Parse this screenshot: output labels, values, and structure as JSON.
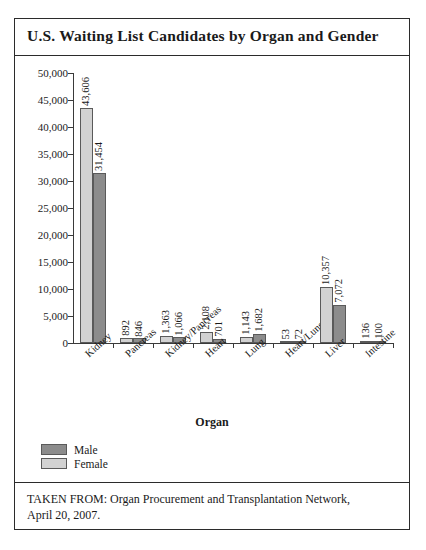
{
  "figure": {
    "title": "U.S. Waiting List Candidates by Organ and Gender",
    "source_line1": "TAKEN FROM: Organ Procurement and Transplantation Network,",
    "source_line2": "April 20, 2007."
  },
  "legend": {
    "male_label": "Male",
    "female_label": "Female"
  },
  "colors": {
    "male_bar": "#d2d2d2",
    "female_bar": "#8c8c8c",
    "male_swatch": "#8c8c8c",
    "female_swatch": "#d2d2d2",
    "axis": "#3a3a3a",
    "border": "#2b2b2b"
  },
  "chart_data": {
    "type": "bar",
    "title": "U.S. Waiting List Candidates by Organ and Gender",
    "xlabel": "Organ",
    "ylabel": "",
    "ylim": [
      0,
      50000
    ],
    "ytick_interval": 5000,
    "grid": false,
    "legend_position": "below-left",
    "categories": [
      "Kidney",
      "Pancreas",
      "Kidney/Pancreas",
      "Heart",
      "Lung",
      "Heart/Lung",
      "Liver",
      "Intestine"
    ],
    "ytick_labels": [
      "0",
      "5,000",
      "10,000",
      "15,000",
      "20,000",
      "25,000",
      "30,000",
      "35,000",
      "40,000",
      "45,000",
      "50,000"
    ],
    "series": [
      {
        "name": "Male",
        "values": [
          43606,
          892,
          1363,
          2108,
          1143,
          53,
          10357,
          136
        ],
        "labels": [
          "43,606",
          "892",
          "1,363",
          "2,108",
          "1,143",
          "53",
          "10,357",
          "136"
        ]
      },
      {
        "name": "Female",
        "values": [
          31454,
          846,
          1066,
          701,
          1682,
          72,
          7072,
          100
        ],
        "labels": [
          "31,454",
          "846",
          "1,066",
          "701",
          "1,682",
          "72",
          "7,072",
          "100"
        ]
      }
    ]
  }
}
